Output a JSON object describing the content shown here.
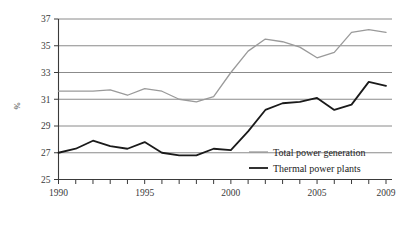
{
  "chart_data": {
    "type": "line",
    "title": "",
    "xlabel": "",
    "ylabel": "%",
    "xlim": [
      1990,
      2009
    ],
    "ylim": [
      25,
      37
    ],
    "yticks": [
      25,
      27,
      29,
      31,
      33,
      35,
      37
    ],
    "ytick_labels": [
      "25",
      "27",
      "29",
      "31",
      "33",
      "35",
      "37"
    ],
    "xticks": [
      1990,
      1991,
      1992,
      1993,
      1994,
      1995,
      1996,
      1997,
      1998,
      1999,
      2000,
      2001,
      2002,
      2003,
      2004,
      2005,
      2006,
      2007,
      2008,
      2009
    ],
    "xtick_labels_shown": [
      "1990",
      "1995",
      "2000",
      "2005",
      "2009"
    ],
    "xtick_labels_shown_at": [
      1990,
      1995,
      2000,
      2005,
      2009
    ],
    "grid": true,
    "grid_axis": "y",
    "legend_position": "lower-right",
    "x": [
      1990,
      1991,
      1992,
      1993,
      1994,
      1995,
      1996,
      1997,
      1998,
      1999,
      2000,
      2001,
      2002,
      2003,
      2004,
      2005,
      2006,
      2007,
      2008,
      2009
    ],
    "series": [
      {
        "name": "Total power generation",
        "color": "#9a9a9a",
        "width": 1.3,
        "values": [
          31.6,
          31.6,
          31.6,
          31.7,
          31.3,
          31.8,
          31.6,
          31.0,
          30.8,
          31.2,
          33.0,
          34.6,
          35.5,
          35.3,
          34.9,
          34.1,
          34.5,
          36.0,
          36.2,
          36.0
        ]
      },
      {
        "name": "Thermal power plants",
        "color": "#1a1a1a",
        "width": 1.8,
        "values": [
          27.0,
          27.3,
          27.9,
          27.5,
          27.3,
          27.8,
          27.0,
          26.8,
          26.8,
          27.3,
          27.2,
          28.6,
          30.2,
          30.7,
          30.8,
          31.1,
          30.2,
          30.6,
          32.3,
          32.0
        ]
      }
    ],
    "legend": [
      {
        "label": "Total power generation",
        "color": "#9a9a9a",
        "width": 1.3
      },
      {
        "label": "Thermal power plants",
        "color": "#1a1a1a",
        "width": 1.8
      }
    ]
  },
  "colors": {
    "axis": "#3a3a3a",
    "grid": "#7e7e7e",
    "background": "#ffffff",
    "total_power_generation": "#9a9a9a",
    "thermal_power_plants": "#1a1a1a"
  }
}
